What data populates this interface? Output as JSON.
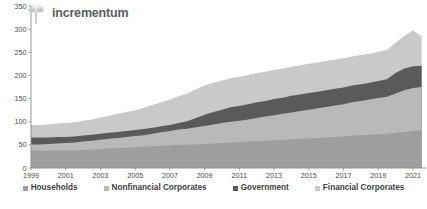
{
  "brand": {
    "name": "incrementum",
    "logo_icon": "tree-icon"
  },
  "footer_note": "",
  "chart_data": {
    "type": "area",
    "stacked": true,
    "title": "",
    "subtitle": "",
    "xlabel": "",
    "ylabel": "",
    "grid": false,
    "legend_position": "bottom",
    "xlim": [
      1999,
      2021.75
    ],
    "ylim": [
      0,
      350
    ],
    "yticks": [
      0,
      50,
      100,
      150,
      200,
      250,
      300,
      350
    ],
    "xticks": [
      1999,
      2001,
      2003,
      2005,
      2007,
      2009,
      2011,
      2013,
      2015,
      2017,
      2019,
      2021
    ],
    "xtick_labels": [
      "1999",
      "2001",
      "2003",
      "2005",
      "2007",
      "2009",
      "2011",
      "2013",
      "2015",
      "2017",
      "2019",
      "2021"
    ],
    "ytick_labels": [
      "0",
      "50",
      "100",
      "150",
      "200",
      "250",
      "300",
      "350"
    ],
    "colors": {
      "households": "#9e9e9e",
      "nonfinancial_corporates": "#b9b9b9",
      "government": "#5a5a5a",
      "financial_corporates": "#c9c9c9"
    },
    "x": [
      1999,
      1999.5,
      2000,
      2000.5,
      2001,
      2001.5,
      2002,
      2002.5,
      2003,
      2003.5,
      2004,
      2004.5,
      2005,
      2005.5,
      2006,
      2006.5,
      2007,
      2007.5,
      2008,
      2008.5,
      2009,
      2009.5,
      2010,
      2010.5,
      2011,
      2011.5,
      2012,
      2012.5,
      2013,
      2013.5,
      2014,
      2014.5,
      2015,
      2015.5,
      2016,
      2016.5,
      2017,
      2017.5,
      2018,
      2018.5,
      2019,
      2019.5,
      2020,
      2020.5,
      2021,
      2021.5
    ],
    "series": [
      {
        "name": "Households",
        "order": 1,
        "color": "#9e9e9e",
        "values": [
          38,
          38,
          38,
          38,
          38,
          38,
          39,
          40,
          41,
          42,
          43,
          44,
          45,
          46,
          47,
          48,
          49,
          50,
          50,
          51,
          52,
          53,
          54,
          55,
          56,
          57,
          58,
          59,
          60,
          61,
          62,
          63,
          64,
          65,
          66,
          67,
          68,
          70,
          71,
          72,
          73,
          74,
          76,
          78,
          80,
          81
        ]
      },
      {
        "name": "Nonfinancial Corporates",
        "order": 2,
        "color": "#b9b9b9",
        "values": [
          13,
          13,
          14,
          15,
          16,
          17,
          18,
          19,
          20,
          21,
          22,
          23,
          24,
          25,
          27,
          29,
          31,
          33,
          35,
          37,
          39,
          41,
          43,
          45,
          46,
          48,
          50,
          52,
          54,
          56,
          58,
          60,
          62,
          64,
          66,
          68,
          70,
          72,
          74,
          76,
          78,
          80,
          85,
          90,
          93,
          94
        ]
      },
      {
        "name": "Government",
        "order": 3,
        "color": "#5a5a5a",
        "values": [
          15,
          15,
          14,
          14,
          13,
          13,
          13,
          13,
          13,
          13,
          13,
          13,
          13,
          13,
          13,
          13,
          13,
          14,
          16,
          20,
          24,
          27,
          29,
          31,
          32,
          33,
          34,
          34,
          35,
          35,
          36,
          36,
          36,
          36,
          36,
          36,
          36,
          36,
          36,
          36,
          37,
          38,
          44,
          47,
          47,
          46
        ]
      },
      {
        "name": "Financial Corporates",
        "order": 4,
        "color": "#c9c9c9",
        "values": [
          27,
          27,
          28,
          29,
          30,
          31,
          32,
          33,
          35,
          37,
          39,
          41,
          43,
          46,
          49,
          52,
          55,
          58,
          60,
          62,
          63,
          63,
          63,
          63,
          63,
          63,
          63,
          63,
          63,
          63,
          63,
          63,
          63,
          63,
          63,
          63,
          63,
          63,
          63,
          63,
          63,
          63,
          66,
          70,
          77,
          64
        ]
      }
    ],
    "legend": [
      {
        "label": "Households",
        "color": "#9e9e9e"
      },
      {
        "label": "Nonfinancial Corporates",
        "color": "#b9b9b9"
      },
      {
        "label": "Government",
        "color": "#5a5a5a"
      },
      {
        "label": "Financial Corporates",
        "color": "#c9c9c9"
      }
    ]
  }
}
